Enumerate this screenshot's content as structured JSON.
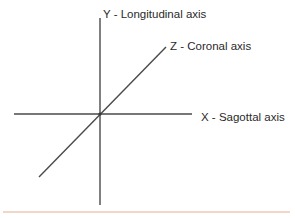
{
  "diagram": {
    "origin": {
      "x": 100,
      "y": 114
    },
    "axes": [
      {
        "id": "y",
        "label": "Y - Longitudinal axis",
        "line": {
          "x1": 100,
          "y1": 18,
          "x2": 100,
          "y2": 205
        },
        "label_pos": {
          "x": 103,
          "y": 18
        }
      },
      {
        "id": "z",
        "label": "Z - Coronal axis",
        "line": {
          "x1": 39,
          "y1": 177,
          "x2": 166,
          "y2": 47
        },
        "label_pos": {
          "x": 170,
          "y": 50
        }
      },
      {
        "id": "x",
        "label": "X - Sagottal axis",
        "line": {
          "x1": 14,
          "y1": 114,
          "x2": 192,
          "y2": 114
        },
        "label_pos": {
          "x": 201,
          "y": 121
        }
      }
    ],
    "colors": {
      "axis": "#4a4a4a",
      "text": "#2a2a2a",
      "divider": "#efc9b8",
      "background": "#ffffff"
    },
    "divider": {
      "x1": 3,
      "y1": 212,
      "x2": 290,
      "y2": 212
    }
  }
}
